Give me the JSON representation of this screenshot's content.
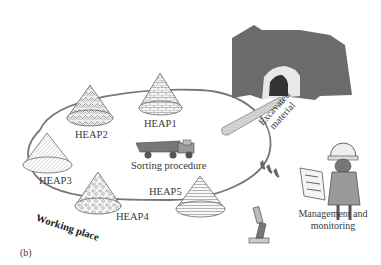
{
  "diagram": {
    "panel_label": "(b)",
    "region_label": "Working place",
    "heaps": [
      {
        "id": "HEAP1",
        "label": "HEAP1",
        "texture": "brick"
      },
      {
        "id": "HEAP2",
        "label": "HEAP2",
        "texture": "swirl"
      },
      {
        "id": "HEAP3",
        "label": "HEAP3",
        "texture": "fine-lines"
      },
      {
        "id": "HEAP4",
        "label": "HEAP4",
        "texture": "gravel"
      },
      {
        "id": "HEAP5",
        "label": "HEAP5",
        "texture": "horizontal-stripes"
      }
    ],
    "sorting": {
      "label": "Sorting procedure",
      "icon": "dump-truck-icon"
    },
    "excavation": {
      "label_line1": "Excavated",
      "label_line2": "material",
      "source": "tunnel-portal"
    },
    "management": {
      "label_line1": "Management and",
      "label_line2": "monitoring",
      "icons": [
        "worker-with-plan-icon",
        "microscope-icon"
      ]
    },
    "arrows": {
      "glyph": "‹‹‹"
    },
    "colors": {
      "outline": "#666666",
      "mountain": "#6b6b6b",
      "text": "#3a3a3a"
    }
  }
}
